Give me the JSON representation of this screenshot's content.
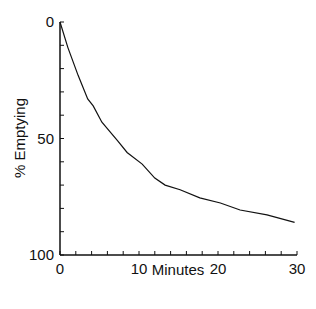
{
  "chart_data": {
    "type": "line",
    "title": "",
    "xlabel": "Minutes",
    "ylabel": "% Emptying",
    "xlim": [
      0,
      30
    ],
    "ylim": [
      0,
      100
    ],
    "y_inverted": true,
    "grid": false,
    "x_ticks": [
      0,
      10,
      20,
      30
    ],
    "x_tick_labels": [
      "0",
      "10",
      "20",
      "30"
    ],
    "x_minor_step": 2,
    "y_ticks": [
      0,
      50,
      100
    ],
    "y_tick_labels": [
      "0",
      "50",
      "100"
    ],
    "y_minor_step": 10,
    "series": [
      {
        "name": "emptying",
        "x": [
          0,
          1,
          2.3,
          3.5,
          4.2,
          5.3,
          7.3,
          8.5,
          10.4,
          12,
          13.3,
          15.2,
          17.7,
          20.3,
          22.8,
          26.2,
          29.7
        ],
        "y": [
          0,
          11,
          23,
          33,
          36,
          43,
          51,
          56,
          61,
          67,
          70,
          72,
          75.5,
          77.7,
          80.7,
          82.8,
          86
        ]
      }
    ]
  }
}
